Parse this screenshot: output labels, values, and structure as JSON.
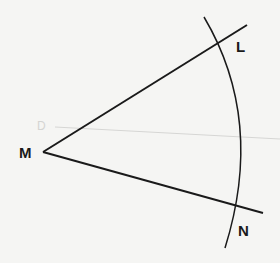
{
  "diagram": {
    "labels": {
      "M": "M",
      "L": "L",
      "N": "N",
      "D": "D"
    },
    "colors": {
      "stroke": "#1a1a1a",
      "faint": "#d6d6d4",
      "background": "#f5f5f3"
    }
  }
}
